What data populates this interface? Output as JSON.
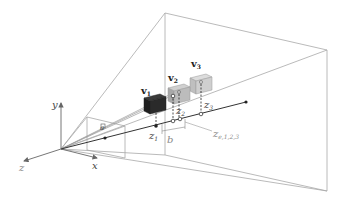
{
  "figure": {
    "axes": {
      "x_label": "x",
      "y_label": "y",
      "z_label": "z"
    },
    "points": {
      "v1": {
        "label": "v",
        "sub": "1"
      },
      "v2": {
        "label": "v",
        "sub": "2"
      },
      "v3": {
        "label": "v",
        "sub": "3"
      }
    },
    "depths": {
      "z1": {
        "label": "z",
        "sub": "1"
      },
      "z2": {
        "label": "z",
        "sub": "2"
      },
      "z3": {
        "label": "z",
        "sub": "3"
      },
      "ze": {
        "label": "z",
        "sub": "e,1,2,3"
      }
    },
    "baseline_label": "b",
    "near_plane_label": "a",
    "colors": {
      "frustum": "#a0a0a0",
      "axes": "#666666",
      "ray": "#333333",
      "cube_v1": "#2a2a2a",
      "cube_v2": "#b8b8b8",
      "cube_v3": "#c8c8c8"
    }
  }
}
